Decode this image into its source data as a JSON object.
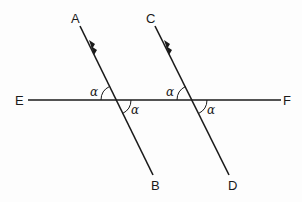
{
  "diagram": {
    "labels": {
      "A": "A",
      "B": "B",
      "C": "C",
      "D": "D",
      "E": "E",
      "F": "F"
    },
    "angles": {
      "ab_upper_left": "α",
      "ab_lower_right": "α",
      "cd_upper_left": "α",
      "cd_lower_right": "α"
    },
    "lines": [
      {
        "name": "EF",
        "from": "E",
        "to": "F",
        "role": "transversal"
      },
      {
        "name": "AB",
        "from": "A",
        "to": "B",
        "role": "parallel",
        "marker": "double-arrow"
      },
      {
        "name": "CD",
        "from": "C",
        "to": "D",
        "role": "parallel",
        "marker": "double-arrow"
      }
    ],
    "stroke_color": "#1a1a1a"
  }
}
